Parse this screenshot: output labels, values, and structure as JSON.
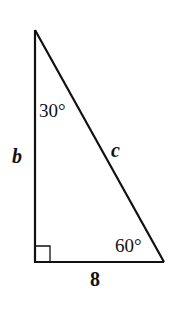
{
  "figure": {
    "type": "right-triangle",
    "vertices": {
      "top": "30°",
      "bottom_right": "60°",
      "bottom_left": "right angle"
    },
    "angles": {
      "top": "30°",
      "bottom_right": "60°"
    },
    "sides": {
      "vertical_leg": "b",
      "hypotenuse": "c",
      "base": "8"
    },
    "colors": {
      "stroke": "#111111",
      "background": "#ffffff"
    }
  }
}
